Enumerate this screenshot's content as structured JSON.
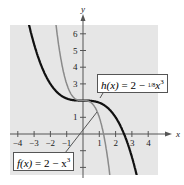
{
  "chart_data": {
    "type": "line",
    "title": "",
    "xlabel": "x",
    "ylabel": "y",
    "xlim": [
      -4.5,
      4.5
    ],
    "ylim": [
      -2.5,
      6.5
    ],
    "x_ticks": [
      -4,
      -3,
      -2,
      -1,
      1,
      2,
      3,
      4
    ],
    "y_ticks": [
      1,
      2,
      3,
      4,
      5,
      6
    ],
    "y_tick_labels": [
      "1",
      "",
      "3",
      "4",
      "5",
      "6"
    ],
    "grid": false,
    "background": "#e6e6e6",
    "series": [
      {
        "name": "h(x) = 2 − (1/8)x³",
        "formula": "2 - x^3/8",
        "color": "#111111",
        "width": 2.2
      },
      {
        "name": "f(x) = 2 − x³",
        "formula": "2 - x^3",
        "color": "#8a8a8a",
        "width": 1.5
      }
    ],
    "annotations": [
      {
        "text_fn": "h(x)",
        "text_eq": " = 2 − ",
        "frac": "1/8",
        "text_tail": "x",
        "exp": "3"
      },
      {
        "text_fn": "f(x)",
        "text_eq": " = 2 − x",
        "exp": "3"
      }
    ]
  }
}
